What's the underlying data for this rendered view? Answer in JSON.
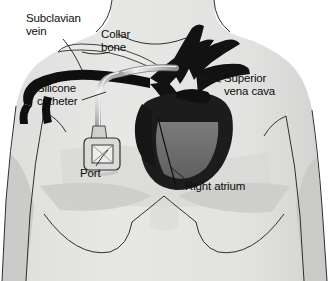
{
  "figure": {
    "type": "medical-illustration",
    "background_color": "#ffffff"
  },
  "palette": {
    "skin_light": "#e4e4e2",
    "skin_mid": "#d4d4d2",
    "skin_shadow": "#c3c3c1",
    "skin_deep": "#b5b5b3",
    "outline": "#2b2b2b",
    "vessel_dark": "#111111",
    "heart_dark": "#1b1b1b",
    "ventricle_gray": "#6e6e6e",
    "catheter_gray": "#bdbdbd",
    "catheter_highlight": "#efefef",
    "port_body": "#d8d8d6",
    "text": "#0d0d0d"
  },
  "labels": [
    {
      "id": "subclavian-vein",
      "text": "Subclavian\nvein",
      "x": 26,
      "y": 12,
      "align": "left"
    },
    {
      "id": "collar-bone",
      "text": "Collar\nbone",
      "x": 101,
      "y": 28,
      "align": "left"
    },
    {
      "id": "silicone-catheter",
      "text": "Silicone\ncatheter",
      "x": 37,
      "y": 82,
      "align": "left"
    },
    {
      "id": "superior-vena-cava",
      "text": "Superior\nvena cava",
      "x": 224,
      "y": 72,
      "align": "left"
    },
    {
      "id": "port",
      "text": "Port",
      "x": 80,
      "y": 167,
      "align": "left"
    },
    {
      "id": "right-atrium",
      "text": "Right atrium",
      "x": 185,
      "y": 180,
      "align": "left"
    }
  ],
  "anatomy": [
    {
      "id": "torso",
      "name": "torso-silhouette"
    },
    {
      "id": "neck",
      "name": "neck"
    },
    {
      "id": "left-arm",
      "name": "left-arm"
    },
    {
      "id": "right-arm",
      "name": "right-arm"
    },
    {
      "id": "clavicle",
      "name": "collar-bone"
    },
    {
      "id": "subclavian",
      "name": "subclavian-vein"
    },
    {
      "id": "svc",
      "name": "superior-vena-cava"
    },
    {
      "id": "heart",
      "name": "heart"
    },
    {
      "id": "right-atrium",
      "name": "right-atrium"
    },
    {
      "id": "catheter",
      "name": "silicone-catheter"
    },
    {
      "id": "port",
      "name": "implanted-port"
    },
    {
      "id": "breast-left",
      "name": "left-breast-contour"
    },
    {
      "id": "breast-right",
      "name": "right-breast-contour"
    }
  ]
}
